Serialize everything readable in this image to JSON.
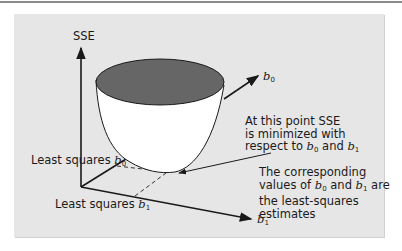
{
  "figure": {
    "colors": {
      "panel_bg": "#e6e6e6",
      "bowl_top": "#666666",
      "bowl_body": "#ffffff",
      "lines": "#1a1a1a"
    },
    "axes": {
      "vertical": "SSE",
      "b0_axis": {
        "var": "b",
        "sub": "0"
      },
      "b1_axis": {
        "var": "b",
        "sub": "1"
      }
    },
    "labels": {
      "ls_b0": {
        "text": "Least squares ",
        "var": "b",
        "sub": "0"
      },
      "ls_b1": {
        "text": "Least squares ",
        "var": "b",
        "sub": "1"
      }
    },
    "annotation_min": {
      "line1": "At this point SSE",
      "line2": "is minimized with",
      "line3_pre": "respect to ",
      "line3_var1": "b",
      "line3_sub1": "0",
      "line3_mid": " and ",
      "line3_var2": "b",
      "line3_sub2": "1"
    },
    "annotation_estimates": {
      "line1": "The corresponding",
      "line2_pre": "values of ",
      "line2_var1": "b",
      "line2_sub1": "0",
      "line2_mid": " and ",
      "line2_var2": "b",
      "line2_sub2": "1",
      "line2_post": " are",
      "line3": "the least-squares",
      "line4": "estimates"
    }
  }
}
